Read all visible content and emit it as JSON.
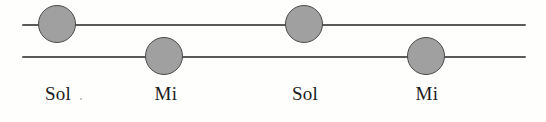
{
  "figure": {
    "background_color": "#fefefc",
    "width": 546,
    "height": 122
  },
  "staff": {
    "line_color": "#5a5a5a",
    "line_thickness": 2,
    "left_x": 22,
    "right_x": 526,
    "lines": [
      {
        "id": "upper-staff-line",
        "y": 24
      },
      {
        "id": "lower-staff-line",
        "y": 56
      }
    ]
  },
  "notes": [
    {
      "id": "note-1",
      "label": "Sol",
      "cx": 57,
      "cy": 24,
      "diameter": 38,
      "line": "upper",
      "fill_color": "#a0a0a0",
      "stroke_color": "#4a4a4a"
    },
    {
      "id": "note-2",
      "label": "Mi",
      "cx": 164,
      "cy": 56,
      "diameter": 38,
      "line": "lower",
      "fill_color": "#a0a0a0",
      "stroke_color": "#4a4a4a"
    },
    {
      "id": "note-3",
      "label": "Sol",
      "cx": 304,
      "cy": 24,
      "diameter": 38,
      "line": "upper",
      "fill_color": "#a0a0a0",
      "stroke_color": "#4a4a4a"
    },
    {
      "id": "note-4",
      "label": "Mi",
      "cx": 426,
      "cy": 56,
      "diameter": 38,
      "line": "lower",
      "fill_color": "#a0a0a0",
      "stroke_color": "#4a4a4a"
    }
  ],
  "labels": [
    {
      "id": "label-1",
      "text": "Sol",
      "cx": 58,
      "y": 84
    },
    {
      "id": "label-2",
      "text": "Mi",
      "cx": 166,
      "y": 84
    },
    {
      "id": "label-3",
      "text": "Sol",
      "cx": 305,
      "y": 84
    },
    {
      "id": "label-4",
      "text": "Mi",
      "cx": 427,
      "y": 84
    }
  ]
}
